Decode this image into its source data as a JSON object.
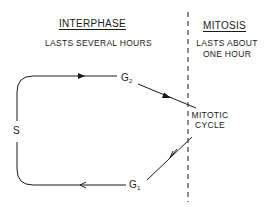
{
  "diagram": {
    "type": "cell-cycle",
    "sections": {
      "interphase": {
        "title": "INTERPHASE",
        "subtitle": "LASTS SEVERAL HOURS"
      },
      "mitosis": {
        "title": "MITOSIS",
        "subtitle_line1": "LASTS ABOUT",
        "subtitle_line2": "ONE HOUR"
      }
    },
    "nodes": {
      "s": {
        "label": "S"
      },
      "g2": {
        "label": "G",
        "sub": "2"
      },
      "g1": {
        "label": "G",
        "sub": "1"
      },
      "mitotic": {
        "line1": "MITOTIC",
        "line2": "CYCLE"
      }
    },
    "edges": [
      {
        "from": "S",
        "to": "G2"
      },
      {
        "from": "G2",
        "to": "MITOTIC CYCLE"
      },
      {
        "from": "MITOTIC CYCLE",
        "to": "G1"
      },
      {
        "from": "G1",
        "to": "S"
      }
    ],
    "colors": {
      "ink": "#1a1a1a",
      "background": "#ffffff"
    }
  }
}
